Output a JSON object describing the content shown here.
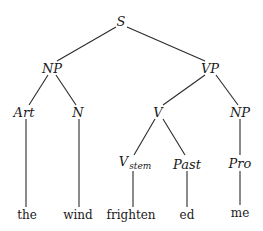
{
  "diagram": {
    "type": "syntax-tree",
    "sentence": "the wind frighten ed me",
    "nodes": {
      "s": {
        "label": "S",
        "x": 121,
        "y": 21
      },
      "np1": {
        "label": "NP",
        "x": 52,
        "y": 68
      },
      "vp": {
        "label": "VP",
        "x": 210,
        "y": 68
      },
      "art": {
        "label": "Art",
        "x": 24,
        "y": 112
      },
      "n": {
        "label": "N",
        "x": 78,
        "y": 112
      },
      "v": {
        "label": "V",
        "x": 158,
        "y": 112
      },
      "np2": {
        "label": "NP",
        "x": 240,
        "y": 112
      },
      "vstem": {
        "label": "V",
        "sub": "stem",
        "x": 135,
        "y": 163
      },
      "past": {
        "label": "Past",
        "x": 187,
        "y": 164
      },
      "pro": {
        "label": "Pro",
        "x": 240,
        "y": 163
      }
    },
    "leaves": {
      "the": {
        "label": "the",
        "x": 27,
        "y": 215
      },
      "wind": {
        "label": "wind",
        "x": 78,
        "y": 215
      },
      "frighten": {
        "label": "frighten",
        "x": 131,
        "y": 215
      },
      "ed": {
        "label": "ed",
        "x": 187,
        "y": 215
      },
      "me": {
        "label": "me",
        "x": 240,
        "y": 213
      }
    },
    "edges": [
      [
        "S",
        "NP"
      ],
      [
        "S",
        "VP"
      ],
      [
        "NP",
        "Art"
      ],
      [
        "NP",
        "N"
      ],
      [
        "VP",
        "V"
      ],
      [
        "VP",
        "NP"
      ],
      [
        "Art",
        "the"
      ],
      [
        "N",
        "wind"
      ],
      [
        "V",
        "V_stem"
      ],
      [
        "V",
        "Past"
      ],
      [
        "NP",
        "Pro"
      ],
      [
        "V_stem",
        "frighten"
      ],
      [
        "Past",
        "ed"
      ],
      [
        "Pro",
        "me"
      ]
    ]
  }
}
